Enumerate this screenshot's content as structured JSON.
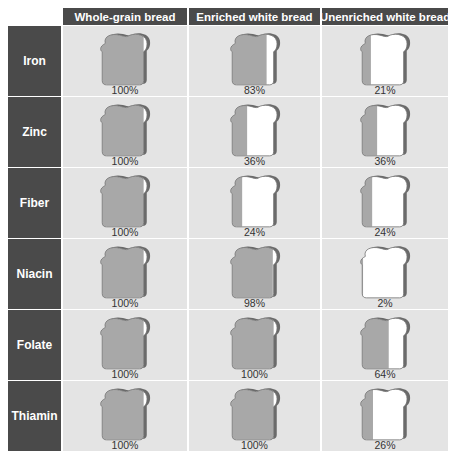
{
  "chart_data": {
    "type": "table",
    "title": "",
    "columns": [
      "Whole-grain bread",
      "Enriched white bread",
      "Unenriched white bread"
    ],
    "rows": [
      "Iron",
      "Zinc",
      "Fiber",
      "Niacin",
      "Folate",
      "Thiamin"
    ],
    "series": [
      {
        "name": "Whole-grain bread",
        "values": [
          100,
          100,
          100,
          100,
          100,
          100
        ]
      },
      {
        "name": "Enriched white bread",
        "values": [
          83,
          36,
          24,
          98,
          100,
          100
        ]
      },
      {
        "name": "Unenriched white bread",
        "values": [
          21,
          36,
          24,
          2,
          64,
          26
        ]
      }
    ],
    "unit": "%",
    "encoding": "bread slice icon filled gray from left proportional to percentage"
  },
  "table": {
    "headers": [
      "Whole-grain bread",
      "Enriched white bread",
      "Unenriched white bread"
    ],
    "rows": [
      {
        "label": "Iron",
        "cells": [
          "100%",
          "83%",
          "21%"
        ]
      },
      {
        "label": "Zinc",
        "cells": [
          "100%",
          "36%",
          "36%"
        ]
      },
      {
        "label": "Fiber",
        "cells": [
          "100%",
          "24%",
          "24%"
        ]
      },
      {
        "label": "Niacin",
        "cells": [
          "100%",
          "98%",
          "2%"
        ]
      },
      {
        "label": "Folate",
        "cells": [
          "100%",
          "100%",
          "64%"
        ]
      },
      {
        "label": "Thiamin",
        "cells": [
          "100%",
          "100%",
          "26%"
        ]
      }
    ]
  },
  "colors": {
    "header_bg": "#4a4a4a",
    "cell_bg": "#e4e4e4",
    "fill": "#a8a8a8",
    "empty": "#ffffff",
    "crust": "#6a6a6a"
  }
}
